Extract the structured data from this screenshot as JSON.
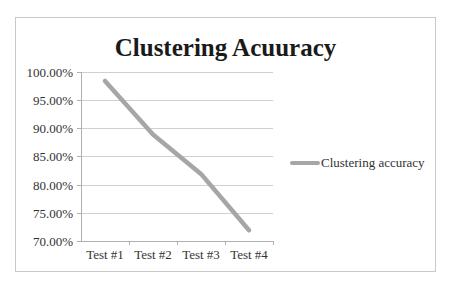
{
  "chart_data": {
    "type": "line",
    "title": "Clustering Acuuracy",
    "xlabel": "",
    "ylabel": "",
    "categories": [
      "Test #1",
      "Test #2",
      "Test #3",
      "Test #4"
    ],
    "series": [
      {
        "name": "Clustering accuracy",
        "values": [
          0.985,
          0.89,
          0.82,
          0.72
        ],
        "color": "#a6a6a6"
      }
    ],
    "ylim": [
      0.7,
      1.0
    ],
    "yticks": [
      1.0,
      0.95,
      0.9,
      0.85,
      0.8,
      0.75,
      0.7
    ],
    "ytick_labels": [
      "100.00%",
      "95.00%",
      "90.00%",
      "85.00%",
      "80.00%",
      "75.00%",
      "70.00%"
    ],
    "grid": {
      "horizontal": true,
      "vertical": false,
      "color": "#d0d0d0"
    },
    "legend": {
      "position": "right",
      "entries": [
        "Clustering accuracy"
      ]
    }
  },
  "title": "Clustering Acuuracy",
  "legend": {
    "label": "Clustering accuracy"
  },
  "y_axis": {
    "labels": [
      "100.00%",
      "95.00%",
      "90.00%",
      "85.00%",
      "80.00%",
      "75.00%",
      "70.00%"
    ]
  },
  "x_axis": {
    "labels": [
      "Test #1",
      "Test #2",
      "Test #3",
      "Test #4"
    ]
  }
}
